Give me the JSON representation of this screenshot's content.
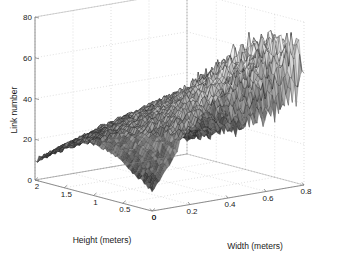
{
  "figure": {
    "background_color": "#ffffff",
    "axis_color": "#808080",
    "grid_color": "#c8c8c8",
    "mesh_color": "#202020",
    "text_color": "#1a1a1a"
  },
  "chart_data": {
    "type": "surface",
    "title": "",
    "xlabel": "Width (meters)",
    "ylabel": "Height (meters)",
    "zlabel": "Link number",
    "grid": true,
    "legend": "none",
    "xlim": [
      0,
      0.8
    ],
    "ylim": [
      0,
      2
    ],
    "zlim": [
      0,
      80
    ],
    "xticks": [
      "0",
      "0.2",
      "0.4",
      "0.6",
      "0.8"
    ],
    "xtick_values": [
      0,
      0.2,
      0.4,
      0.6,
      0.8
    ],
    "yticks": [
      "2",
      "1.5",
      "1",
      "0.5",
      "0"
    ],
    "ytick_values": [
      2,
      1.5,
      1,
      0.5,
      0
    ],
    "zticks": [
      "0",
      "20",
      "40",
      "60",
      "80"
    ],
    "ztick_values": [
      0,
      20,
      40,
      60,
      80
    ],
    "x": [
      0.0,
      0.04,
      0.08,
      0.12,
      0.16,
      0.2,
      0.24,
      0.28,
      0.32,
      0.36,
      0.4,
      0.44,
      0.48,
      0.52,
      0.56,
      0.6,
      0.64,
      0.68,
      0.72,
      0.76,
      0.8
    ],
    "y": [
      0.0,
      0.1,
      0.2,
      0.3,
      0.4,
      0.5,
      0.6,
      0.7,
      0.8,
      0.9,
      1.0,
      1.1,
      1.2,
      1.3,
      1.4,
      1.5,
      1.6,
      1.7,
      1.8,
      1.9,
      2.0
    ],
    "z": [
      [
        10,
        14,
        20,
        26,
        33,
        36,
        40,
        44,
        47,
        52,
        58,
        63,
        66,
        70,
        68,
        72,
        69,
        74,
        66,
        70,
        52
      ],
      [
        12,
        17,
        23,
        29,
        34,
        38,
        43,
        46,
        50,
        55,
        60,
        65,
        62,
        68,
        71,
        66,
        72,
        68,
        70,
        64,
        48
      ],
      [
        14,
        19,
        25,
        31,
        36,
        40,
        44,
        48,
        52,
        56,
        59,
        62,
        64,
        66,
        63,
        69,
        66,
        70,
        63,
        58,
        44
      ],
      [
        16,
        21,
        27,
        32,
        37,
        41,
        45,
        49,
        51,
        54,
        57,
        60,
        62,
        63,
        60,
        64,
        61,
        65,
        58,
        52,
        40
      ],
      [
        18,
        23,
        28,
        33,
        38,
        42,
        45,
        47,
        50,
        52,
        54,
        57,
        59,
        60,
        57,
        60,
        57,
        60,
        54,
        48,
        36
      ],
      [
        20,
        25,
        30,
        34,
        38,
        41,
        44,
        46,
        48,
        50,
        52,
        54,
        56,
        57,
        54,
        56,
        53,
        56,
        50,
        44,
        33
      ],
      [
        22,
        26,
        31,
        35,
        38,
        41,
        43,
        45,
        47,
        48,
        50,
        52,
        53,
        54,
        51,
        53,
        50,
        52,
        46,
        40,
        30
      ],
      [
        23,
        27,
        31,
        35,
        38,
        40,
        42,
        44,
        45,
        47,
        48,
        50,
        51,
        51,
        49,
        50,
        47,
        49,
        43,
        37,
        28
      ],
      [
        24,
        28,
        32,
        35,
        37,
        39,
        41,
        42,
        44,
        45,
        46,
        47,
        48,
        48,
        46,
        47,
        44,
        46,
        40,
        34,
        26
      ],
      [
        25,
        28,
        31,
        34,
        36,
        38,
        39,
        41,
        42,
        43,
        44,
        45,
        45,
        46,
        44,
        44,
        41,
        43,
        37,
        31,
        24
      ],
      [
        25,
        28,
        31,
        33,
        35,
        36,
        38,
        39,
        40,
        41,
        41,
        42,
        43,
        43,
        41,
        41,
        38,
        40,
        34,
        29,
        22
      ],
      [
        25,
        27,
        30,
        32,
        33,
        35,
        36,
        37,
        38,
        38,
        39,
        39,
        40,
        40,
        38,
        38,
        36,
        37,
        31,
        26,
        20
      ],
      [
        24,
        26,
        28,
        30,
        31,
        33,
        34,
        34,
        35,
        36,
        36,
        36,
        37,
        37,
        35,
        35,
        33,
        34,
        29,
        24,
        18
      ],
      [
        23,
        25,
        27,
        28,
        30,
        31,
        31,
        32,
        33,
        33,
        33,
        34,
        34,
        34,
        32,
        32,
        30,
        31,
        26,
        22,
        17
      ],
      [
        22,
        23,
        25,
        26,
        28,
        28,
        29,
        30,
        30,
        31,
        31,
        31,
        31,
        31,
        29,
        29,
        27,
        28,
        24,
        20,
        15
      ],
      [
        20,
        22,
        23,
        24,
        26,
        26,
        27,
        27,
        28,
        28,
        28,
        28,
        28,
        28,
        27,
        26,
        25,
        25,
        22,
        18,
        14
      ],
      [
        18,
        20,
        21,
        22,
        23,
        24,
        24,
        25,
        25,
        25,
        26,
        26,
        26,
        25,
        24,
        24,
        22,
        23,
        20,
        16,
        12
      ],
      [
        16,
        18,
        19,
        20,
        21,
        21,
        22,
        22,
        23,
        23,
        23,
        23,
        23,
        23,
        22,
        21,
        20,
        20,
        17,
        14,
        11
      ],
      [
        14,
        15,
        16,
        17,
        18,
        19,
        19,
        20,
        20,
        20,
        20,
        20,
        20,
        20,
        19,
        19,
        17,
        18,
        15,
        13,
        10
      ],
      [
        12,
        13,
        14,
        15,
        16,
        16,
        17,
        17,
        17,
        18,
        18,
        18,
        17,
        17,
        17,
        16,
        15,
        15,
        13,
        11,
        8
      ],
      [
        9,
        10,
        11,
        12,
        13,
        13,
        14,
        14,
        15,
        15,
        15,
        15,
        15,
        14,
        14,
        13,
        12,
        12,
        11,
        9,
        7
      ]
    ]
  }
}
